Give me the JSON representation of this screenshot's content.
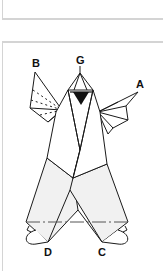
{
  "diagram": {
    "type": "origami-fold-diagram",
    "labels": {
      "a": "A",
      "b": "B",
      "c": "C",
      "d": "D",
      "g": "G"
    },
    "colors": {
      "line": "#1a1a1a",
      "fill_light": "#f1f1f1",
      "fill_white": "#ffffff",
      "card_border": "#d4d4d4"
    }
  }
}
